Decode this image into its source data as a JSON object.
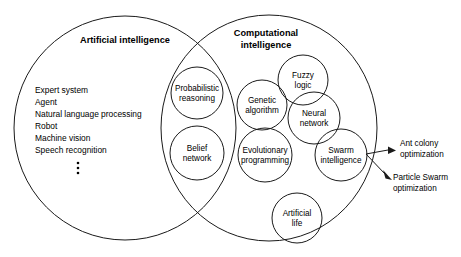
{
  "diagram": {
    "type": "venn-diagram",
    "stroke_color": "#1a1a1a",
    "background_color": "#ffffff",
    "sets": [
      {
        "id": "artificial-intelligence",
        "title": "Artificial intelligence",
        "title_lines": [
          "Artificial intelligence"
        ]
      },
      {
        "id": "computational-intelligence",
        "title": "Computational intelligence",
        "title_lines": [
          "Computational",
          "intelligence"
        ]
      }
    ],
    "ai_list": [
      "Expert system",
      "Agent",
      "Natural language processing",
      "Robot",
      "Machine vision",
      "Speech recognition"
    ],
    "ai_list_ellipsis": "⋮",
    "intersection_nodes": [
      {
        "id": "probabilistic-reasoning",
        "lines": [
          "Probabilistic",
          "reasoning"
        ]
      },
      {
        "id": "belief-network",
        "lines": [
          "Belief",
          "network"
        ]
      }
    ],
    "ci_nodes": [
      {
        "id": "genetic-algorithm",
        "lines": [
          "Genetic",
          "algorithm"
        ]
      },
      {
        "id": "fuzzy-logic",
        "lines": [
          "Fuzzy",
          "logic"
        ]
      },
      {
        "id": "neural-network",
        "lines": [
          "Neural",
          "network"
        ]
      },
      {
        "id": "evolutionary-programming",
        "lines": [
          "Evolutionary",
          "programming"
        ]
      },
      {
        "id": "swarm-intelligence",
        "lines": [
          "Swarm",
          "intelligence"
        ]
      },
      {
        "id": "artificial-life",
        "lines": [
          "Artificial",
          "life"
        ]
      }
    ],
    "callouts": [
      {
        "id": "ant-colony-optimization",
        "lines": [
          "Ant colony",
          "optimization"
        ]
      },
      {
        "id": "particle-swarm-optimization",
        "lines": [
          "Particle Swarm",
          "optimization"
        ]
      }
    ]
  }
}
